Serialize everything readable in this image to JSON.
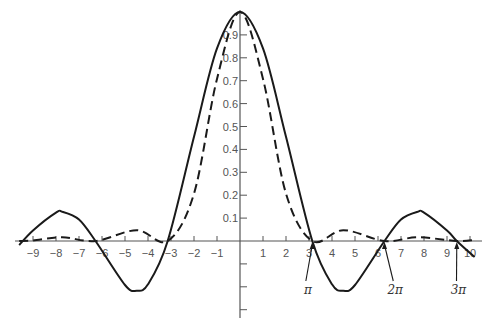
{
  "chart_data": {
    "type": "line",
    "title": "",
    "xlabel": "",
    "ylabel": "",
    "xlim": [
      -9.6,
      10.3
    ],
    "ylim": [
      -0.3,
      1.0
    ],
    "grid": false,
    "legend": null,
    "x_ticks": [
      -9,
      -8,
      -7,
      -6,
      -5,
      -4,
      -3,
      -2,
      -1,
      1,
      2,
      3,
      4,
      5,
      6,
      7,
      8,
      9,
      10
    ],
    "x_tick_labels": [
      "−9",
      "−8",
      "−7",
      "−6",
      "−5",
      "−4",
      "−3",
      "−2",
      "−1",
      "1",
      "2",
      "3",
      "4",
      "5",
      "6",
      "7",
      "8",
      "9",
      "10"
    ],
    "y_ticks": [
      0.1,
      0.2,
      0.3,
      0.4,
      0.5,
      0.6,
      0.7,
      0.8,
      0.9,
      -0.1,
      -0.2,
      -0.3
    ],
    "y_tick_labels": [
      "0.1",
      "0.2",
      "0.3",
      "0.4",
      "0.5",
      "0.6",
      "0.7",
      "0.8",
      "0.9",
      "",
      "",
      ""
    ],
    "annotations": [
      {
        "label": "π",
        "x": 3.1416,
        "text_x": 2.95,
        "text_y": -0.38
      },
      {
        "label": "2π",
        "x": 6.2832,
        "text_x": 6.75,
        "text_y": -0.38
      },
      {
        "label": "3π",
        "x": 9.4248,
        "text_x": 9.5,
        "text_y": -0.38
      }
    ],
    "series": [
      {
        "name": "sin(x)/x",
        "style": "solid",
        "x": [
          -9.6,
          -9,
          -8,
          -7.725,
          -7,
          -6.283,
          -5,
          -4.493,
          -4,
          -3.142,
          -2,
          -1,
          0,
          1,
          2,
          3.142,
          4,
          4.493,
          5,
          6.283,
          7,
          7.725,
          8,
          9,
          9.425,
          10.2
        ],
        "values": [
          -0.018,
          0.046,
          0.124,
          0.128,
          0.094,
          0.0,
          -0.192,
          -0.217,
          -0.189,
          0.0,
          0.455,
          0.841,
          1.0,
          0.841,
          0.455,
          0.0,
          -0.189,
          -0.217,
          -0.192,
          0.0,
          0.094,
          0.128,
          0.124,
          0.046,
          0.0,
          -0.07
        ]
      },
      {
        "name": "(sin(x)/x)^2",
        "style": "dashed",
        "x": [
          -9.6,
          -9,
          -7.725,
          -6.283,
          -4.493,
          -3.142,
          -2,
          -1,
          0,
          1,
          2,
          3.142,
          4.493,
          6.283,
          7.725,
          9.425,
          10.2
        ],
        "values": [
          0.0003,
          0.002,
          0.016,
          0.0,
          0.047,
          0.0,
          0.207,
          0.708,
          1.0,
          0.708,
          0.207,
          0.0,
          0.047,
          0.0,
          0.016,
          0.0,
          0.005
        ]
      }
    ],
    "colors": {
      "curve": "#1a1a1a",
      "axis": "#555555"
    }
  }
}
